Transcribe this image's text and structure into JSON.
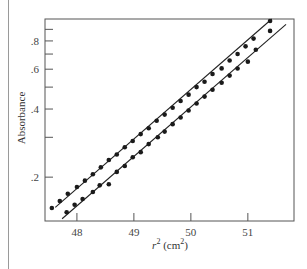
{
  "chart_data": {
    "type": "scatter",
    "title": "",
    "xlabel": "r² (cm²)",
    "xlabel_var": "r",
    "xlabel_unit": " (cm²)",
    "ylabel": "Absorbance",
    "yscale": "log",
    "xlim": [
      47.44,
      51.81
    ],
    "ylim": [
      0.128,
      1.0
    ],
    "xticks": [
      48,
      49,
      50,
      51
    ],
    "xtick_labels": [
      "48",
      "49",
      "50",
      "51"
    ],
    "yticks_major": [
      0.2,
      0.4,
      0.6,
      0.8
    ],
    "ytick_labels": [
      ".2",
      ".4",
      ".6",
      ".8"
    ],
    "yticks_minor": [
      0.3,
      0.5,
      0.7,
      0.9
    ],
    "grid": false,
    "legend": null,
    "series": [
      {
        "name": "upper",
        "marker": "circle",
        "fit_line": {
          "x": [
            47.62,
            51.42
          ],
          "y": [
            0.147,
            1.0
          ]
        },
        "x": [
          47.56,
          47.7,
          47.84,
          48.0,
          48.14,
          48.28,
          48.42,
          48.56,
          48.7,
          48.84,
          48.98,
          49.12,
          49.26,
          49.4,
          49.54,
          49.68,
          49.82,
          49.96,
          50.1,
          50.24,
          50.38,
          50.54,
          50.68,
          50.82,
          50.96,
          51.1,
          51.39
        ],
        "y": [
          0.146,
          0.157,
          0.169,
          0.181,
          0.193,
          0.206,
          0.221,
          0.238,
          0.252,
          0.271,
          0.289,
          0.31,
          0.329,
          0.355,
          0.378,
          0.405,
          0.434,
          0.463,
          0.5,
          0.528,
          0.571,
          0.605,
          0.656,
          0.7,
          0.757,
          0.819,
          0.98
        ]
      },
      {
        "name": "lower",
        "marker": "circle",
        "fit_line": {
          "x": [
            47.74,
            51.67
          ],
          "y": [
            0.131,
            0.947
          ]
        },
        "x": [
          47.82,
          47.96,
          48.1,
          48.28,
          48.4,
          48.56,
          48.7,
          48.84,
          48.98,
          49.12,
          49.26,
          49.42,
          49.54,
          49.68,
          49.82,
          49.96,
          50.1,
          50.24,
          50.38,
          50.54,
          50.68,
          50.82,
          51.0,
          51.14,
          51.39
        ],
        "y": [
          0.14,
          0.151,
          0.16,
          0.172,
          0.184,
          0.186,
          0.211,
          0.224,
          0.245,
          0.258,
          0.28,
          0.3,
          0.318,
          0.343,
          0.367,
          0.394,
          0.423,
          0.454,
          0.487,
          0.523,
          0.562,
          0.604,
          0.648,
          0.731,
          0.886
        ]
      }
    ]
  },
  "layout_px": {
    "frame": {
      "left": 45,
      "top": 19,
      "right": 294,
      "bottom": 221
    }
  }
}
